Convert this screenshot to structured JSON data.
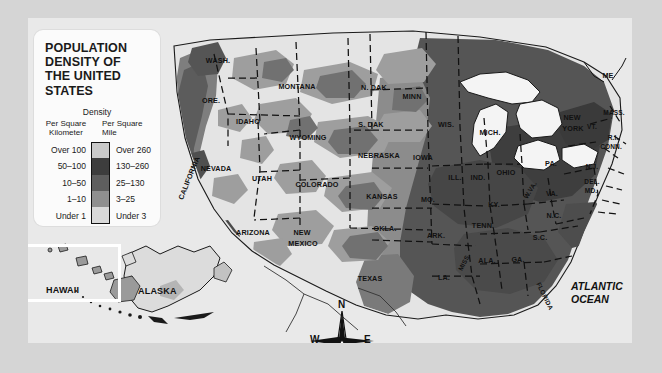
{
  "legend": {
    "title_lines": [
      "POPULATION",
      "DENSITY OF",
      "THE UNITED",
      "STATES"
    ],
    "density_heading": "Density",
    "unit_left": "Per Square\nKilometer",
    "unit_left_line1": "Per Square",
    "unit_left_line2": "Kilometer",
    "unit_right_line1": "Per Square",
    "unit_right_line2": "Mile",
    "classes": [
      {
        "per_km": "Over 100",
        "per_mile": "Over 260",
        "color": "#c9c9c9"
      },
      {
        "per_km": "50–100",
        "per_mile": "130–260",
        "color": "#3d3d3d"
      },
      {
        "per_km": "10–50",
        "per_mile": "25–130",
        "color": "#5e5e5e"
      },
      {
        "per_km": "1–10",
        "per_mile": "3–25",
        "color": "#8f8f8f"
      },
      {
        "per_km": "Under 1",
        "per_mile": "Under 3",
        "color": "#d9d9d9"
      }
    ]
  },
  "map": {
    "ocean_label_line1": "ATLANTIC",
    "ocean_label_line2": "OCEAN",
    "insets": {
      "hawaii": "HAWAII",
      "alaska": "ALASKA"
    },
    "compass": {
      "n": "N",
      "s": "S",
      "e": "E",
      "w": "W"
    },
    "states": [
      {
        "name": "WASH.",
        "x": 218,
        "y": 60,
        "size": "sm"
      },
      {
        "name": "ORE.",
        "x": 211,
        "y": 100,
        "size": "sm"
      },
      {
        "name": "IDAHO",
        "x": 248,
        "y": 121,
        "size": "sm"
      },
      {
        "name": "MONTANA",
        "x": 297,
        "y": 86,
        "size": "sm"
      },
      {
        "name": "WYOMING",
        "x": 308,
        "y": 137,
        "size": "sm"
      },
      {
        "name": "NEVADA",
        "x": 216,
        "y": 168,
        "size": "sm"
      },
      {
        "name": "UTAH",
        "x": 262,
        "y": 178,
        "size": "sm"
      },
      {
        "name": "COLORADO",
        "x": 317,
        "y": 184,
        "size": "sm"
      },
      {
        "name": "CALIFORNIA",
        "x": 189,
        "y": 178,
        "size": "sm",
        "rot": -68
      },
      {
        "name": "ARIZONA",
        "x": 253,
        "y": 232,
        "size": "sm"
      },
      {
        "name": "NEW",
        "x": 302,
        "y": 232,
        "size": "sm"
      },
      {
        "name": "MEXICO",
        "x": 303,
        "y": 243,
        "size": "sm"
      },
      {
        "name": "N. DAK.",
        "x": 375,
        "y": 87,
        "size": "sm"
      },
      {
        "name": "S. DAK",
        "x": 371,
        "y": 124,
        "size": "sm"
      },
      {
        "name": "NEBRASKA",
        "x": 379,
        "y": 155,
        "size": "sm"
      },
      {
        "name": "KANSAS",
        "x": 382,
        "y": 196,
        "size": "sm"
      },
      {
        "name": "OKLA.",
        "x": 385,
        "y": 228,
        "size": "sm"
      },
      {
        "name": "TEXAS",
        "x": 370,
        "y": 278,
        "size": "sm"
      },
      {
        "name": "MINN",
        "x": 412,
        "y": 96,
        "size": "sm"
      },
      {
        "name": "IOWA",
        "x": 423,
        "y": 157,
        "size": "sm"
      },
      {
        "name": "MO.",
        "x": 428,
        "y": 199,
        "size": "sm"
      },
      {
        "name": "ARK.",
        "x": 436,
        "y": 235,
        "size": "sm"
      },
      {
        "name": "LA.",
        "x": 444,
        "y": 277,
        "size": "sm"
      },
      {
        "name": "WIS.",
        "x": 446,
        "y": 124,
        "size": "sm"
      },
      {
        "name": "ILL.",
        "x": 455,
        "y": 177,
        "size": "sm"
      },
      {
        "name": "MISS.",
        "x": 464,
        "y": 262,
        "size": "xs",
        "rot": -62
      },
      {
        "name": "ALA.",
        "x": 487,
        "y": 260,
        "size": "sm"
      },
      {
        "name": "TENN.",
        "x": 483,
        "y": 225,
        "size": "sm"
      },
      {
        "name": "KY.",
        "x": 494,
        "y": 204,
        "size": "sm"
      },
      {
        "name": "IND.",
        "x": 478,
        "y": 177,
        "size": "sm"
      },
      {
        "name": "MICH.",
        "x": 490,
        "y": 132,
        "size": "sm"
      },
      {
        "name": "OHIO",
        "x": 506,
        "y": 172,
        "size": "sm"
      },
      {
        "name": "W.VA.",
        "x": 530,
        "y": 190,
        "size": "xs",
        "rot": -58
      },
      {
        "name": "VA.",
        "x": 552,
        "y": 193,
        "size": "sm"
      },
      {
        "name": "N.C.",
        "x": 554,
        "y": 215,
        "size": "sm"
      },
      {
        "name": "S.C.",
        "x": 540,
        "y": 237,
        "size": "sm"
      },
      {
        "name": "GA.",
        "x": 518,
        "y": 259,
        "size": "sm"
      },
      {
        "name": "FLORIDA",
        "x": 545,
        "y": 296,
        "size": "xs",
        "rot": 64
      },
      {
        "name": "PA.",
        "x": 551,
        "y": 163,
        "size": "sm"
      },
      {
        "name": "NEW",
        "x": 572,
        "y": 117,
        "size": "sm"
      },
      {
        "name": "YORK",
        "x": 573,
        "y": 128,
        "size": "sm"
      },
      {
        "name": "ME",
        "x": 608,
        "y": 75,
        "size": "sm"
      },
      {
        "name": "MASS.",
        "x": 614,
        "y": 112,
        "size": "xs"
      },
      {
        "name": "VT.",
        "x": 592,
        "y": 126,
        "size": "xs"
      },
      {
        "name": "R.I.",
        "x": 613,
        "y": 137,
        "size": "xs"
      },
      {
        "name": "CONN.",
        "x": 611,
        "y": 146,
        "size": "xs"
      },
      {
        "name": "N.J.",
        "x": 592,
        "y": 166,
        "size": "xs"
      },
      {
        "name": "DEL.",
        "x": 592,
        "y": 181,
        "size": "xs"
      },
      {
        "name": "MD.",
        "x": 591,
        "y": 190,
        "size": "xs"
      }
    ]
  },
  "colors": {
    "page_bg": "#d5d5d5",
    "map_bg": "#e9e9e9",
    "legend_bg": "#fbfbfb",
    "ink": "#111111",
    "tone_lightest": "#e6e6e6",
    "tone_light": "#d2d2d2",
    "tone_mid": "#9a9a9a",
    "tone_dark": "#6a6a6a",
    "tone_darkest": "#474747"
  }
}
